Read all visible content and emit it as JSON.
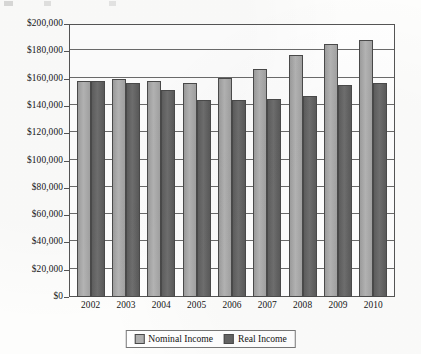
{
  "chart_data": {
    "type": "bar",
    "title": "",
    "subtitle": "",
    "xlabel": "",
    "ylabel": "",
    "ylim": [
      0,
      200000
    ],
    "ytick_step": 20000,
    "grid": true,
    "legend_position": "bottom",
    "categories": [
      "2002",
      "2003",
      "2004",
      "2005",
      "2006",
      "2007",
      "2008",
      "2009",
      "2010"
    ],
    "ytick_labels": [
      "$0",
      "$20,000",
      "$40,000",
      "$60,000",
      "$80,000",
      "$100,000",
      "$120,000",
      "$140,000",
      "$160,000",
      "$180,000",
      "$200,000"
    ],
    "ytick_values": [
      0,
      20000,
      40000,
      60000,
      80000,
      100000,
      120000,
      140000,
      160000,
      180000,
      200000
    ],
    "series": [
      {
        "name": "Nominal Income",
        "color": "#b0b0b0",
        "values": [
          158500,
          159500,
          158000,
          156500,
          160500,
          167000,
          177000,
          185000,
          188500
        ]
      },
      {
        "name": "Real Income",
        "color": "#646464",
        "values": [
          158500,
          157000,
          151500,
          144500,
          144500,
          145000,
          147500,
          155000,
          156500
        ]
      }
    ]
  },
  "legend": {
    "items": [
      {
        "label": "Nominal Income",
        "swatch": "nominal-swatch"
      },
      {
        "label": "Real Income",
        "swatch": "real-swatch"
      }
    ]
  },
  "colors": {
    "nominal": "#b0b0b0",
    "real": "#646464",
    "axis": "#555555",
    "grid": "#6b6b6b",
    "background": "#ffffff"
  }
}
